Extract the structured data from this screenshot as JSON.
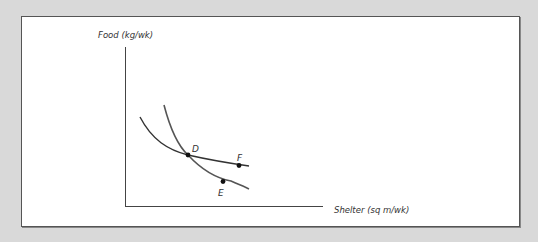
{
  "diagram": {
    "type": "indifference-curves",
    "y_axis_label": "Food (kg/wk)",
    "x_axis_label": "Shelter (sq m/wk)",
    "curves": [
      {
        "name": "flatter-indifference-curve",
        "passes_through": [
          "D",
          "F"
        ]
      },
      {
        "name": "steeper-indifference-curve",
        "passes_through": [
          "D",
          "E"
        ]
      }
    ],
    "points": [
      {
        "label": "D"
      },
      {
        "label": "E"
      },
      {
        "label": "F"
      }
    ],
    "colors": {
      "background": "#d9d9d9",
      "panel": "#ffffff",
      "ink": "#333333",
      "steep_curve": "#555555"
    }
  }
}
